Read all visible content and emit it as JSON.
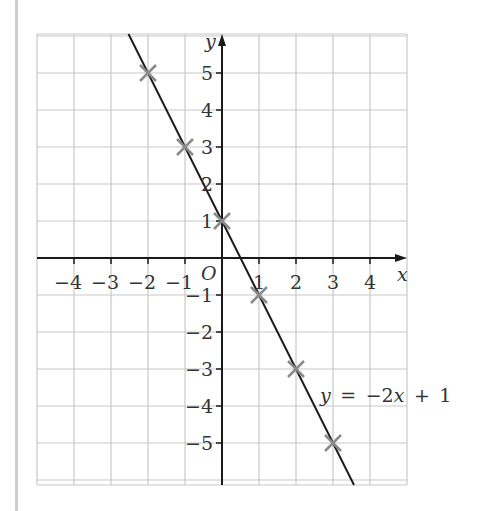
{
  "chart_data": {
    "type": "line",
    "title": "",
    "xlabel": "x",
    "ylabel": "y",
    "origin_label": "O",
    "xlim": [
      -5,
      5
    ],
    "ylim": [
      -6,
      6
    ],
    "grid": true,
    "x_ticks": [
      -4,
      -3,
      -2,
      -1,
      1,
      2,
      3,
      4
    ],
    "x_tick_labels": [
      "−4",
      "−3",
      "−2",
      "−1",
      "1",
      "2",
      "3",
      "4"
    ],
    "y_ticks": [
      5,
      4,
      3,
      2,
      1,
      -1,
      -2,
      -3,
      -4,
      -5
    ],
    "y_tick_labels": [
      "5",
      "4",
      "3",
      "2",
      "1",
      "−1",
      "−2",
      "−3",
      "−4",
      "−5"
    ],
    "series": [
      {
        "name": "y = −2x + 1",
        "equation": "y = −2x + 1",
        "slope": -2,
        "intercept": 1,
        "line_color": "#1a1a1a",
        "marker": "x",
        "marker_color": "#8a8a8a",
        "points": [
          {
            "x": -2,
            "y": 5
          },
          {
            "x": -1,
            "y": 3
          },
          {
            "x": 0,
            "y": 1
          },
          {
            "x": 1,
            "y": -1
          },
          {
            "x": 2,
            "y": -3
          },
          {
            "x": 3,
            "y": -5
          }
        ]
      }
    ],
    "annotations": [
      {
        "text": "y = −2x + 1",
        "x": 2.7,
        "y": -3.6
      }
    ],
    "colors": {
      "grid": "#c8c8c8",
      "axis": "#1a1a1a",
      "margin_bar": "#cfcfcf"
    }
  }
}
